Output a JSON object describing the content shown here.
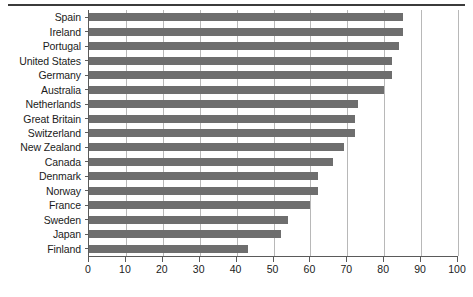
{
  "chart_data": {
    "type": "bar",
    "orientation": "horizontal",
    "title": "",
    "xlabel": "",
    "ylabel": "",
    "xlim": [
      0,
      100
    ],
    "xticks": [
      0,
      10,
      20,
      30,
      40,
      50,
      60,
      70,
      80,
      90,
      100
    ],
    "xtick_labels": [
      "0",
      "10",
      "20",
      "30",
      "40",
      "50",
      "60",
      "70",
      "80",
      "90",
      "100"
    ],
    "grid": "vertical",
    "legend": "none",
    "bar_color": "#6e6e6e",
    "categories": [
      "Spain",
      "Ireland",
      "Portugal",
      "United States",
      "Germany",
      "Australia",
      "Netherlands",
      "Great Britain",
      "Switzerland",
      "New Zealand",
      "Canada",
      "Denmark",
      "Norway",
      "France",
      "Sweden",
      "Japan",
      "Finland"
    ],
    "values": [
      85,
      85,
      84,
      82,
      82,
      80,
      73,
      72,
      72,
      69,
      66,
      62,
      62,
      60,
      54,
      52,
      43
    ]
  }
}
